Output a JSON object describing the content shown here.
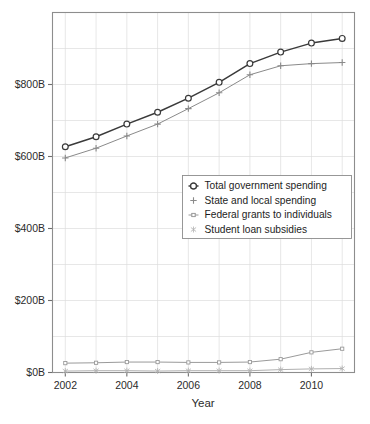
{
  "chart_data": {
    "type": "line",
    "title": "",
    "xlabel": "Year",
    "ylabel": "",
    "xlim": [
      2001.6,
      2011.4
    ],
    "ylim": [
      0,
      1000
    ],
    "grid": true,
    "legend_position": "center-right",
    "x": [
      2002,
      2003,
      2004,
      2005,
      2006,
      2007,
      2008,
      2009,
      2010,
      2011
    ],
    "y_tick_values": [
      0,
      200,
      400,
      600,
      800
    ],
    "y_tick_labels": [
      "$0B",
      "$200B",
      "$400B",
      "$600B",
      "$800B"
    ],
    "x_tick_values": [
      2002,
      2004,
      2006,
      2008,
      2010
    ],
    "x_tick_labels": [
      "2002",
      "2004",
      "2006",
      "2008",
      "2010"
    ],
    "series": [
      {
        "name": "Total government spending",
        "marker": "circle",
        "color": "#3a3a3a",
        "values": [
          627,
          655,
          690,
          723,
          762,
          806,
          858,
          890,
          915,
          928
        ]
      },
      {
        "name": "State and local spending",
        "marker": "plus",
        "color": "#8a8a8a",
        "values": [
          596,
          623,
          657,
          690,
          733,
          777,
          827,
          852,
          858,
          861
        ]
      },
      {
        "name": "Federal grants to individuals",
        "marker": "dot",
        "color": "#9a9a9a",
        "values": [
          26,
          27,
          29,
          29,
          28,
          28,
          29,
          37,
          56,
          66
        ]
      },
      {
        "name": "Student loan subsidies",
        "marker": "asterisk",
        "color": "#b0b0b0",
        "values": [
          4,
          5,
          5,
          4,
          5,
          5,
          5,
          8,
          10,
          11
        ]
      }
    ]
  },
  "legend": {
    "entries": [
      {
        "label": "Total government spending"
      },
      {
        "label": "State and local spending"
      },
      {
        "label": "Federal grants to individuals"
      },
      {
        "label": "Student loan subsidies"
      }
    ]
  }
}
